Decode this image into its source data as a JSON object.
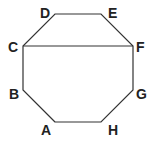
{
  "diagram": {
    "type": "octagon",
    "stroke_color": "#333333",
    "vertices": [
      {
        "label": "A",
        "x": 55,
        "y": 122,
        "lx": 41,
        "ly": 135
      },
      {
        "label": "B",
        "x": 23,
        "y": 90,
        "lx": 9,
        "ly": 99
      },
      {
        "label": "C",
        "x": 23,
        "y": 46,
        "lx": 8,
        "ly": 52
      },
      {
        "label": "D",
        "x": 55,
        "y": 14,
        "lx": 40,
        "ly": 18
      },
      {
        "label": "E",
        "x": 101,
        "y": 14,
        "lx": 108,
        "ly": 18
      },
      {
        "label": "F",
        "x": 133,
        "y": 46,
        "lx": 136,
        "ly": 52
      },
      {
        "label": "G",
        "x": 133,
        "y": 90,
        "lx": 136,
        "ly": 99
      },
      {
        "label": "H",
        "x": 101,
        "y": 122,
        "lx": 108,
        "ly": 135
      }
    ],
    "chords": [
      {
        "from": "C",
        "to": "F"
      }
    ]
  }
}
